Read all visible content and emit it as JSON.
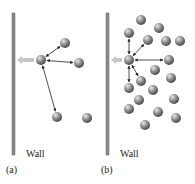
{
  "panels": [
    {
      "id": "a",
      "caption": "(a)",
      "wall_label": "Wall",
      "wall": {
        "x": 12,
        "y1": 13,
        "y2": 155
      },
      "center": {
        "x": 41,
        "y": 60
      },
      "molecules": [
        [
          65,
          43
        ],
        [
          79,
          63
        ],
        [
          57,
          117
        ],
        [
          87,
          118
        ]
      ],
      "arrows_to": [
        [
          65,
          43
        ],
        [
          79,
          63
        ],
        [
          57,
          117
        ]
      ]
    },
    {
      "id": "b",
      "caption": "(b)",
      "wall_label": "Wall",
      "wall": {
        "x": 106,
        "y1": 13,
        "y2": 155
      },
      "center": {
        "x": 129,
        "y": 60
      },
      "molecules": [
        [
          141,
          20
        ],
        [
          159,
          28
        ],
        [
          129,
          33
        ],
        [
          148,
          40
        ],
        [
          166,
          41
        ],
        [
          180,
          41
        ],
        [
          169,
          60
        ],
        [
          155,
          70
        ],
        [
          171,
          78
        ],
        [
          141,
          81
        ],
        [
          129,
          88
        ],
        [
          153,
          90
        ],
        [
          139,
          100
        ],
        [
          174,
          99
        ],
        [
          129,
          109
        ],
        [
          158,
          112
        ],
        [
          176,
          118
        ],
        [
          145,
          125
        ]
      ],
      "arrows_to": [
        [
          129,
          33
        ],
        [
          148,
          40
        ],
        [
          169,
          60
        ],
        [
          141,
          81
        ],
        [
          129,
          88
        ]
      ]
    }
  ],
  "colors": {
    "wall": "#8a8a8a",
    "molecule": "#7d7d7d",
    "arrow": "#222222",
    "push_arrow": "#c8c8c8"
  }
}
